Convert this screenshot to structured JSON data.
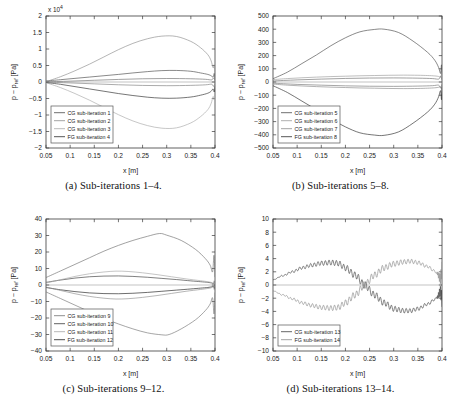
{
  "figure": {
    "name": "sub-iteration-pressure-figure",
    "axis_labels": {
      "x": "x [m]",
      "y": "p − p_ref [Pa]",
      "y_main": "p − p",
      "y_sub": "ref",
      "y_unit": " [Pa]"
    }
  },
  "chart_data": [
    {
      "id": "a",
      "type": "line",
      "title": "",
      "caption": "(a) Sub-iterations 1–4.",
      "xlabel": "x [m]",
      "ylabel": "p − p_ref [Pa]",
      "xlim": [
        0.05,
        0.4
      ],
      "ylim": [
        -20000,
        20000
      ],
      "xticks": [
        0.05,
        0.1,
        0.15,
        0.2,
        0.25,
        0.3,
        0.35,
        0.4
      ],
      "xticklabels": [
        "0.05",
        "0.1",
        "0.15",
        "0.2",
        "0.25",
        "0.3",
        "0.35",
        "0.4"
      ],
      "yticks": [
        -20000,
        -15000,
        -10000,
        -5000,
        0,
        5000,
        10000,
        15000,
        20000
      ],
      "yticklabels": [
        "−2",
        "−1.5",
        "−1",
        "−0.5",
        "0",
        "0.5",
        "1",
        "1.5",
        "2"
      ],
      "y_exponent": "x 10",
      "y_exponent_power": "4",
      "grid": false,
      "legend_position": "lower left",
      "series": [
        {
          "name": "CG sub-iteration 1",
          "color": "#4a4a4a",
          "x": [
            0.05,
            0.08,
            0.11,
            0.14,
            0.17,
            0.2,
            0.23,
            0.26,
            0.29,
            0.32,
            0.35,
            0.37,
            0.385,
            0.392,
            0.396,
            0.3985,
            0.4
          ],
          "values": [
            300,
            700,
            1100,
            1500,
            1900,
            2300,
            2750,
            3150,
            3450,
            3500,
            3250,
            2750,
            2300,
            1900,
            1500,
            2600,
            900
          ]
        },
        {
          "name": "CG sub-iteration 2",
          "color": "#8c8c8c",
          "x": [
            0.05,
            0.08,
            0.11,
            0.14,
            0.17,
            0.2,
            0.23,
            0.26,
            0.29,
            0.32,
            0.35,
            0.37,
            0.385,
            0.392,
            0.396,
            0.3985,
            0.4
          ],
          "values": [
            100,
            1600,
            3400,
            5400,
            7600,
            9800,
            11700,
            13100,
            13900,
            13800,
            12300,
            10400,
            8300,
            6400,
            4300,
            5200,
            2400
          ]
        },
        {
          "name": "CG sub-iteration 3",
          "color": "#a8a8a8",
          "x": [
            0.05,
            0.08,
            0.11,
            0.14,
            0.17,
            0.2,
            0.23,
            0.26,
            0.29,
            0.32,
            0.35,
            0.37,
            0.385,
            0.392,
            0.396,
            0.3985,
            0.4
          ],
          "values": [
            -200,
            -1700,
            -3500,
            -5500,
            -7700,
            -9900,
            -11800,
            -13200,
            -14000,
            -13900,
            -12400,
            -10500,
            -8400,
            -6500,
            -4400,
            -5400,
            -2600
          ]
        },
        {
          "name": "FG sub-iteration 4",
          "color": "#2b2b2b",
          "x": [
            0.05,
            0.08,
            0.11,
            0.14,
            0.17,
            0.2,
            0.23,
            0.26,
            0.29,
            0.32,
            0.35,
            0.37,
            0.385,
            0.392,
            0.396,
            0.3985,
            0.4
          ],
          "values": [
            -150,
            -700,
            -1400,
            -2100,
            -2800,
            -3500,
            -4100,
            -4600,
            -4900,
            -4900,
            -4550,
            -4000,
            -3400,
            -2800,
            -2100,
            -3000,
            -1200
          ]
        },
        {
          "name": "aux-1",
          "color": "#6e6e6e",
          "x": [
            0.05,
            0.1,
            0.15,
            0.2,
            0.25,
            0.3,
            0.35,
            0.38,
            0.393,
            0.397,
            0.4
          ],
          "values": [
            60,
            260,
            520,
            780,
            980,
            1060,
            980,
            820,
            650,
            1250,
            400
          ]
        },
        {
          "name": "aux-2",
          "color": "#7d7d7d",
          "x": [
            0.05,
            0.1,
            0.15,
            0.2,
            0.25,
            0.3,
            0.35,
            0.38,
            0.393,
            0.397,
            0.4
          ],
          "values": [
            -60,
            -280,
            -560,
            -840,
            -1040,
            -1120,
            -1020,
            -860,
            -680,
            -1320,
            -420
          ]
        }
      ]
    },
    {
      "id": "b",
      "type": "line",
      "title": "",
      "caption": "(b) Sub-iterations 5–8.",
      "xlabel": "x [m]",
      "ylabel": "p − p_ref [Pa]",
      "xlim": [
        0.05,
        0.4
      ],
      "ylim": [
        -500,
        500
      ],
      "xticks": [
        0.05,
        0.1,
        0.15,
        0.2,
        0.25,
        0.3,
        0.35,
        0.4
      ],
      "xticklabels": [
        "0.05",
        "0.1",
        "0.15",
        "0.2",
        "0.25",
        "0.3",
        "0.35",
        "0.4"
      ],
      "yticks": [
        -500,
        -400,
        -300,
        -200,
        -100,
        0,
        100,
        200,
        300,
        400,
        500
      ],
      "yticklabels": [
        "−500",
        "−400",
        "−300",
        "−200",
        "−100",
        "0",
        "100",
        "200",
        "300",
        "400",
        "500"
      ],
      "y_exponent": "",
      "y_exponent_power": "",
      "grid": false,
      "legend_position": "lower left",
      "series": [
        {
          "name": "CG sub-iteration 5",
          "color": "#4a4a4a",
          "x": [
            0.05,
            0.08,
            0.11,
            0.14,
            0.17,
            0.2,
            0.23,
            0.26,
            0.28,
            0.31,
            0.34,
            0.37,
            0.385,
            0.393,
            0.397,
            0.399,
            0.4
          ],
          "values": [
            25,
            75,
            140,
            205,
            275,
            335,
            380,
            398,
            400,
            375,
            310,
            225,
            165,
            110,
            65,
            130,
            40
          ]
        },
        {
          "name": "CG sub-iteration 6",
          "color": "#9a9a9a",
          "x": [
            0.05,
            0.08,
            0.11,
            0.14,
            0.17,
            0.2,
            0.23,
            0.26,
            0.29,
            0.32,
            0.35,
            0.37,
            0.385,
            0.393,
            0.397,
            0.399,
            0.4
          ],
          "values": [
            18,
            26,
            32,
            37,
            41,
            44,
            47,
            49,
            51,
            52,
            51,
            49,
            46,
            42,
            38,
            55,
            30
          ]
        },
        {
          "name": "CG sub-iteration 7",
          "color": "#8a8a8a",
          "x": [
            0.05,
            0.08,
            0.11,
            0.14,
            0.17,
            0.2,
            0.23,
            0.26,
            0.29,
            0.32,
            0.35,
            0.37,
            0.385,
            0.393,
            0.397,
            0.399,
            0.4
          ],
          "values": [
            -16,
            -24,
            -30,
            -35,
            -39,
            -42,
            -45,
            -47,
            -49,
            -50,
            -49,
            -47,
            -44,
            -40,
            -36,
            -52,
            -28
          ]
        },
        {
          "name": "FG sub-iteration 8",
          "color": "#2b2b2b",
          "x": [
            0.05,
            0.08,
            0.11,
            0.14,
            0.17,
            0.2,
            0.23,
            0.26,
            0.28,
            0.31,
            0.34,
            0.37,
            0.385,
            0.393,
            0.397,
            0.399,
            0.4
          ],
          "values": [
            -28,
            -80,
            -145,
            -210,
            -280,
            -340,
            -385,
            -402,
            -404,
            -378,
            -312,
            -228,
            -168,
            -112,
            -66,
            -134,
            -42
          ]
        },
        {
          "name": "aux-b1",
          "color": "#707070",
          "x": [
            0.05,
            0.1,
            0.15,
            0.2,
            0.25,
            0.3,
            0.35,
            0.38,
            0.393,
            0.397,
            0.4
          ],
          "values": [
            8,
            16,
            22,
            27,
            30,
            31,
            29,
            26,
            22,
            42,
            16
          ]
        },
        {
          "name": "aux-b2",
          "color": "#767676",
          "x": [
            0.05,
            0.1,
            0.15,
            0.2,
            0.25,
            0.3,
            0.35,
            0.38,
            0.393,
            0.397,
            0.4
          ],
          "values": [
            -9,
            -18,
            -24,
            -29,
            -32,
            -33,
            -31,
            -28,
            -24,
            -45,
            -18
          ]
        }
      ]
    },
    {
      "id": "c",
      "type": "line",
      "title": "",
      "caption": "(c) Sub-iterations 9–12.",
      "xlabel": "x [m]",
      "ylabel": "p − p_ref [Pa]",
      "xlim": [
        0.05,
        0.4
      ],
      "ylim": [
        -40,
        40
      ],
      "xticks": [
        0.05,
        0.1,
        0.15,
        0.2,
        0.25,
        0.3,
        0.35,
        0.4
      ],
      "xticklabels": [
        "0.05",
        "0.1",
        "0.15",
        "0.2",
        "0.25",
        "0.3",
        "0.35",
        "0.4"
      ],
      "yticks": [
        -40,
        -30,
        -20,
        -10,
        0,
        10,
        20,
        30,
        40
      ],
      "yticklabels": [
        "−40",
        "−30",
        "−20",
        "−10",
        "0",
        "10",
        "20",
        "30",
        "40"
      ],
      "y_exponent": "",
      "y_exponent_power": "",
      "grid": false,
      "legend_position": "lower left",
      "series": [
        {
          "name": "CG sub-iteration 9",
          "color": "#707070",
          "x": [
            0.05,
            0.08,
            0.11,
            0.14,
            0.17,
            0.2,
            0.23,
            0.26,
            0.285,
            0.3,
            0.33,
            0.36,
            0.38,
            0.39,
            0.395,
            0.398,
            0.4
          ],
          "values": [
            4.5,
            8.5,
            12.5,
            16.5,
            20.5,
            24,
            27,
            29.5,
            31.2,
            30.2,
            27,
            21.5,
            16,
            12,
            8,
            18,
            5
          ]
        },
        {
          "name": "CG sub-iteration 10",
          "color": "#3a3a3a",
          "x": [
            0.05,
            0.08,
            0.11,
            0.14,
            0.17,
            0.2,
            0.23,
            0.26,
            0.29,
            0.32,
            0.35,
            0.37,
            0.385,
            0.393,
            0.397,
            0.399,
            0.4
          ],
          "values": [
            1.6,
            3.0,
            4.2,
            5.0,
            5.4,
            5.5,
            5.2,
            4.7,
            4.0,
            3.3,
            2.5,
            2.0,
            1.6,
            1.2,
            0.9,
            2.4,
            0.6
          ]
        },
        {
          "name": "CG sub-iteration 11",
          "color": "#a5a5a5",
          "x": [
            0.05,
            0.08,
            0.11,
            0.14,
            0.17,
            0.195,
            0.22,
            0.25,
            0.28,
            0.31,
            0.34,
            0.37,
            0.385,
            0.393,
            0.397,
            0.399,
            0.4
          ],
          "values": [
            1.2,
            3.2,
            5.2,
            6.8,
            7.9,
            8.4,
            8.2,
            7.4,
            6.3,
            5.0,
            3.7,
            2.6,
            2.0,
            1.5,
            1.1,
            3.0,
            0.8
          ]
        },
        {
          "name": "FG sub-iteration 12",
          "color": "#1f1f1f",
          "x": [
            0.05,
            0.08,
            0.11,
            0.14,
            0.17,
            0.2,
            0.23,
            0.26,
            0.29,
            0.32,
            0.35,
            0.37,
            0.385,
            0.393,
            0.397,
            0.399,
            0.4
          ],
          "values": [
            -1.5,
            -2.9,
            -4.0,
            -4.8,
            -5.2,
            -5.3,
            -5.0,
            -4.5,
            -3.8,
            -3.1,
            -2.4,
            -1.9,
            -1.5,
            -1.1,
            -0.8,
            -2.2,
            -0.5
          ]
        },
        {
          "name": "aux-c1",
          "color": "#8e8e8e",
          "x": [
            0.05,
            0.08,
            0.11,
            0.14,
            0.17,
            0.195,
            0.22,
            0.25,
            0.28,
            0.31,
            0.34,
            0.37,
            0.385,
            0.393,
            0.397,
            0.399,
            0.4
          ],
          "values": [
            -1.3,
            -3.3,
            -5.3,
            -6.9,
            -8.0,
            -8.5,
            -8.3,
            -7.5,
            -6.4,
            -5.1,
            -3.8,
            -2.7,
            -2.1,
            -1.6,
            -1.2,
            -3.1,
            -0.9
          ]
        },
        {
          "name": "aux-c2",
          "color": "#757575",
          "x": [
            0.05,
            0.08,
            0.11,
            0.14,
            0.17,
            0.2,
            0.23,
            0.26,
            0.29,
            0.305,
            0.33,
            0.36,
            0.38,
            0.39,
            0.395,
            0.398,
            0.4
          ],
          "values": [
            -4.2,
            -8.2,
            -12.2,
            -16.2,
            -20.2,
            -23.6,
            -26.6,
            -29.0,
            -30.2,
            -30.0,
            -26.6,
            -21.0,
            -15.5,
            -11.5,
            -7.8,
            -17.5,
            -4.8
          ]
        }
      ]
    },
    {
      "id": "d",
      "type": "line",
      "title": "",
      "caption": "(d) Sub-iterations 13–14.",
      "xlabel": "x [m]",
      "ylabel": "p − p_ref [Pa]",
      "xlim": [
        0.05,
        0.4
      ],
      "ylim": [
        -10,
        10
      ],
      "xticks": [
        0.05,
        0.1,
        0.15,
        0.2,
        0.25,
        0.3,
        0.35,
        0.4
      ],
      "xticklabels": [
        "0.05",
        "0.1",
        "0.15",
        "0.2",
        "0.25",
        "0.3",
        "0.35",
        "0.4"
      ],
      "yticks": [
        -10,
        -8,
        -6,
        -4,
        -2,
        0,
        2,
        4,
        6,
        8,
        10
      ],
      "yticklabels": [
        "−10",
        "−8",
        "−6",
        "−4",
        "−2",
        "0",
        "2",
        "4",
        "6",
        "8",
        "10"
      ],
      "y_exponent": "",
      "y_exponent_power": "",
      "grid": false,
      "legend_position": "lower left",
      "oscillatory": true,
      "series": [
        {
          "name": "CG sub-iteration 13",
          "color": "#3f3f3f",
          "ripple": 0.55,
          "ripple_n": 46,
          "x": [
            0.05,
            0.07,
            0.09,
            0.11,
            0.13,
            0.15,
            0.17,
            0.185,
            0.2,
            0.22,
            0.24,
            0.26,
            0.28,
            0.3,
            0.32,
            0.335,
            0.35,
            0.37,
            0.385,
            0.393,
            0.397,
            0.4
          ],
          "values": [
            0.8,
            1.4,
            2.0,
            2.6,
            3.0,
            3.3,
            3.4,
            3.3,
            2.6,
            1.5,
            0.0,
            -1.5,
            -2.7,
            -3.6,
            -3.9,
            -3.9,
            -3.6,
            -2.9,
            -2.2,
            -1.5,
            -0.8,
            -2.0
          ]
        },
        {
          "name": "FG sub-iteration 14",
          "color": "#8a8a8a",
          "ripple": 0.55,
          "ripple_n": 46,
          "x": [
            0.05,
            0.07,
            0.09,
            0.11,
            0.13,
            0.15,
            0.17,
            0.185,
            0.2,
            0.22,
            0.24,
            0.26,
            0.28,
            0.3,
            0.32,
            0.335,
            0.35,
            0.37,
            0.385,
            0.393,
            0.397,
            0.4
          ],
          "values": [
            -0.9,
            -1.5,
            -2.1,
            -2.7,
            -3.1,
            -3.4,
            -3.5,
            -3.4,
            -2.7,
            -1.5,
            0.0,
            1.5,
            2.6,
            3.2,
            3.5,
            3.6,
            3.4,
            2.8,
            2.1,
            1.4,
            0.8,
            2.2
          ]
        }
      ]
    }
  ]
}
